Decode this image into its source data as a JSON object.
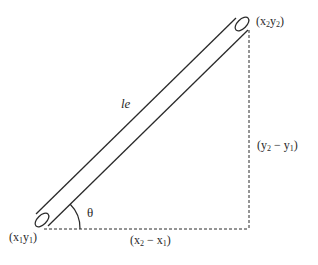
{
  "diagram": {
    "type": "inclined-bar-element",
    "element_label": "le",
    "angle_label": "θ",
    "start_node": {
      "label": "(x1y1)",
      "x_sub": "1",
      "y_sub": "1"
    },
    "end_node": {
      "label": "(x2y2)",
      "x_sub": "2",
      "y_sub": "2"
    },
    "horizontal_projection": {
      "label": "(x2 − x1)"
    },
    "vertical_projection": {
      "label": "(y2 − y1)"
    },
    "colors": {
      "stroke": "#2a2a2a",
      "background": "#ffffff"
    }
  },
  "text": {
    "le": "le",
    "theta": "θ",
    "x": "x",
    "y": "y",
    "one": "1",
    "two": "2",
    "open": "(",
    "close": ")",
    "minus": " − "
  }
}
